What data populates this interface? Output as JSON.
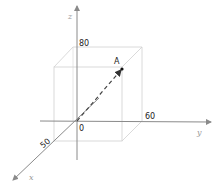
{
  "diagram": {
    "type": "3d-coordinate-system",
    "axes": {
      "x": {
        "label": "x",
        "tick": "50"
      },
      "y": {
        "label": "y",
        "tick": "60"
      },
      "z": {
        "label": "z",
        "tick": "80"
      }
    },
    "origin_label": "0",
    "point": {
      "label": "A",
      "coords": [
        50,
        60,
        80
      ]
    },
    "colors": {
      "axis": "#8a8a8a",
      "box": "#cfcfcf",
      "vector": "#444444",
      "text": "#222222"
    }
  }
}
